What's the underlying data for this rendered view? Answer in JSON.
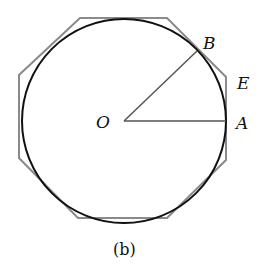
{
  "figure": {
    "caption": "(b)",
    "labels": {
      "O": "O",
      "A": "A",
      "B": "B",
      "E": "E"
    },
    "colors": {
      "circle": "#111111",
      "octagon": "#8a8a8a",
      "radii": "#555555",
      "text": "#111111"
    }
  }
}
